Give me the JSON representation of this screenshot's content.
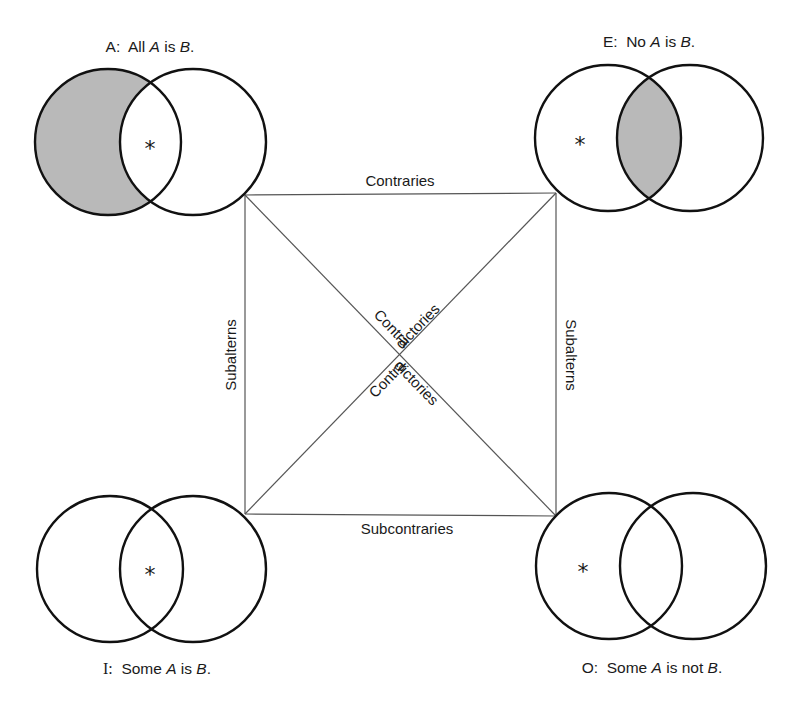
{
  "diagram": {
    "type": "square-of-opposition",
    "colors": {
      "stroke": "#111111",
      "shade": "#b9b9b9",
      "edge": "#555555"
    },
    "corners": {
      "A": {
        "letter": "A:",
        "text_pre": "All ",
        "term1": "A",
        "mid": " is ",
        "term2": "B",
        "end": ".",
        "shaded_region": "A-only",
        "asterisk_region": "A-and-B"
      },
      "E": {
        "letter": "E:",
        "text_pre": "No ",
        "term1": "A",
        "mid": " is ",
        "term2": "B",
        "end": ".",
        "shaded_region": "A-and-B",
        "asterisk_region": "A-only"
      },
      "I": {
        "letter": "I:",
        "text_pre": "Some ",
        "term1": "A",
        "mid": " is ",
        "term2": "B",
        "end": ".",
        "shaded_region": "none",
        "asterisk_region": "A-and-B"
      },
      "O": {
        "letter": "O:",
        "text_pre": "Some ",
        "term1": "A",
        "mid": " is not ",
        "term2": "B",
        "end": ".",
        "shaded_region": "none",
        "asterisk_region": "A-only"
      }
    },
    "asterisk": "*",
    "relations": {
      "top": "Contraries",
      "bottom": "Subcontraries",
      "left": "Subalterns",
      "right": "Subalterns",
      "diagonal_part1": "Contra",
      "diagonal_part2": "dictories"
    }
  }
}
